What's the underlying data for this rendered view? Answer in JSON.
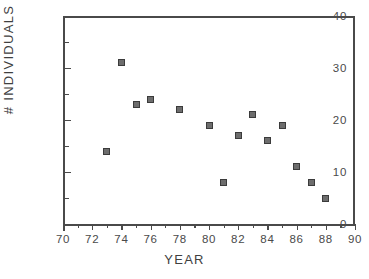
{
  "chart_data": {
    "type": "scatter",
    "title": "",
    "xlabel": "YEAR",
    "ylabel": "# INDIVIDUALS",
    "xlim": [
      70,
      90
    ],
    "ylim": [
      0,
      40
    ],
    "grid": false,
    "legend": null,
    "x_major_ticks": [
      70,
      72,
      74,
      76,
      78,
      80,
      82,
      84,
      86,
      88,
      90
    ],
    "x_minor_ticks": [
      71,
      73,
      75,
      77,
      79,
      81,
      83,
      85,
      87,
      89
    ],
    "y_major_ticks": [
      0,
      10,
      20,
      30,
      40
    ],
    "y_minor_ticks": [
      5,
      15,
      25,
      35
    ],
    "x_tick_labels": [
      "70",
      "72",
      "74",
      "76",
      "78",
      "80",
      "82",
      "84",
      "86",
      "88",
      "90"
    ],
    "y_tick_labels": [
      "0",
      "10",
      "20",
      "30",
      "40"
    ],
    "marker": "square",
    "marker_color": "#6d6d6d",
    "marker_edge_color": "#3b3b3b",
    "axis_color": "#4a4a4a",
    "x": [
      73,
      74,
      75,
      76,
      78,
      80,
      81,
      82,
      83,
      84,
      85,
      86,
      87,
      88
    ],
    "y": [
      14,
      31,
      23,
      24,
      22,
      19,
      8,
      17,
      21,
      16,
      19,
      11,
      8,
      5
    ],
    "points": [
      {
        "x": 73,
        "y": 14
      },
      {
        "x": 74,
        "y": 31
      },
      {
        "x": 75,
        "y": 23
      },
      {
        "x": 76,
        "y": 24
      },
      {
        "x": 78,
        "y": 22
      },
      {
        "x": 80,
        "y": 19
      },
      {
        "x": 81,
        "y": 8
      },
      {
        "x": 82,
        "y": 17
      },
      {
        "x": 83,
        "y": 21
      },
      {
        "x": 84,
        "y": 16
      },
      {
        "x": 85,
        "y": 19
      },
      {
        "x": 86,
        "y": 11
      },
      {
        "x": 87,
        "y": 8
      },
      {
        "x": 88,
        "y": 5
      }
    ]
  }
}
